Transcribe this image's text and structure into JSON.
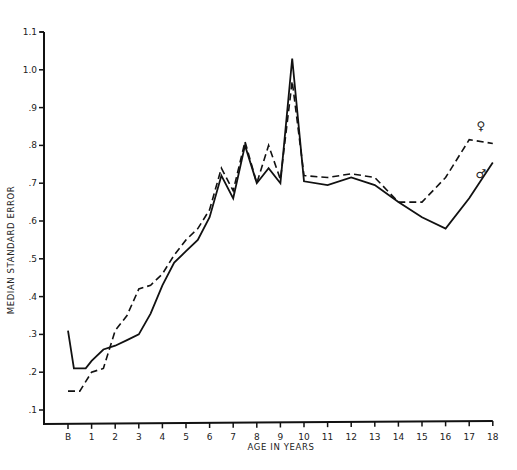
{
  "chart_data": {
    "type": "line",
    "title": "",
    "xlabel": "AGE IN YEARS",
    "ylabel": "MEDIAN STANDARD ERROR",
    "xlim": [
      0,
      18
    ],
    "ylim": [
      0.06,
      1.1
    ],
    "grid": false,
    "legend_position": "inline labels at right end of lines",
    "x_tick_labels": [
      "B",
      "1",
      "2",
      "3",
      "4",
      "5",
      "6",
      "7",
      "8",
      "9",
      "10",
      "11",
      "12",
      "13",
      "14",
      "15",
      "16",
      "17",
      "18"
    ],
    "x_tick_values": [
      0,
      1,
      2,
      3,
      4,
      5,
      6,
      7,
      8,
      9,
      10,
      11,
      12,
      13,
      14,
      15,
      16,
      17,
      18
    ],
    "y_tick_labels": [
      ".1",
      ".2",
      ".3",
      ".4",
      ".5",
      ".6",
      ".7",
      ".8",
      ".9",
      "1.0",
      "1.1"
    ],
    "y_tick_values": [
      0.1,
      0.2,
      0.3,
      0.4,
      0.5,
      0.6,
      0.7,
      0.8,
      0.9,
      1.0,
      1.1
    ],
    "series": [
      {
        "name": "♂",
        "label": "Male",
        "style": "solid",
        "color": "#111111",
        "x": [
          0,
          0.25,
          0.75,
          1,
          1.5,
          2,
          2.5,
          3,
          3.5,
          4,
          4.5,
          5,
          5.5,
          6,
          6.5,
          7,
          7.5,
          8,
          8.5,
          9,
          9.5,
          10,
          11,
          12,
          13,
          14,
          15,
          16,
          17,
          18
        ],
        "values": [
          0.31,
          0.21,
          0.21,
          0.23,
          0.26,
          0.27,
          0.285,
          0.3,
          0.355,
          0.43,
          0.49,
          0.52,
          0.55,
          0.61,
          0.72,
          0.66,
          0.8,
          0.7,
          0.74,
          0.7,
          1.03,
          0.705,
          0.695,
          0.715,
          0.695,
          0.65,
          0.61,
          0.58,
          0.66,
          0.755
        ]
      },
      {
        "name": "♀",
        "label": "Female",
        "style": "dashed",
        "color": "#111111",
        "x": [
          0,
          0.5,
          1,
          1.5,
          2,
          2.5,
          3,
          3.5,
          4,
          4.5,
          5,
          5.5,
          6,
          6.5,
          7,
          7.5,
          8,
          8.5,
          9,
          9.5,
          10,
          11,
          12,
          13,
          14,
          15,
          16,
          17,
          18
        ],
        "values": [
          0.15,
          0.15,
          0.2,
          0.21,
          0.31,
          0.35,
          0.42,
          0.43,
          0.46,
          0.51,
          0.55,
          0.58,
          0.63,
          0.74,
          0.68,
          0.81,
          0.7,
          0.8,
          0.71,
          0.97,
          0.72,
          0.715,
          0.725,
          0.715,
          0.65,
          0.65,
          0.715,
          0.815,
          0.805
        ]
      }
    ],
    "annotations": [
      {
        "text": "♀",
        "near_series": "Female",
        "x": 17.5,
        "y": 0.84
      },
      {
        "text": "♂",
        "near_series": "Male",
        "x": 17.5,
        "y": 0.715
      }
    ]
  }
}
